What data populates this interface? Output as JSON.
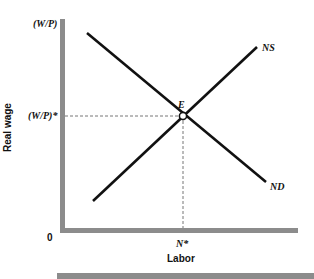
{
  "diagram": {
    "axes": {
      "y_label": "Real wage",
      "x_label": "Labor",
      "origin_label": "0",
      "y_top_label": "(W/P)",
      "y_equilibrium_label": "(W/P)*",
      "x_equilibrium_label": "N*"
    },
    "curves": {
      "supply_label": "NS",
      "demand_label": "ND"
    },
    "equilibrium_label": "E",
    "colors": {
      "axis": "#8c8c8c",
      "curve": "#111111",
      "dashed": "#777777"
    }
  }
}
